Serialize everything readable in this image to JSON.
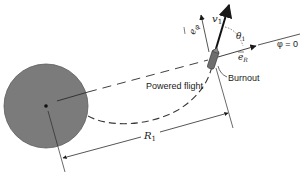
{
  "diagram": {
    "labels": {
      "powered_flight": "Powered flight",
      "burnout": "Burnout",
      "phi_zero": "φ = 0",
      "v1": "v",
      "v1_sub": "1",
      "theta1": "θ",
      "theta1_sub": "1",
      "e_R": "e",
      "e_R_sub": "R",
      "e_phi": "e",
      "e_phi_sub": "φ",
      "R1": "R",
      "R1_sub": "1"
    },
    "elements": [
      {
        "id": "planet",
        "type": "circle",
        "description": "Central body (filled gray disc) with center point marker"
      },
      {
        "id": "reference-axis",
        "type": "dashed-line",
        "description": "Radial line from planet center through burnout point, labeled phi = 0"
      },
      {
        "id": "powered-flight-path",
        "type": "dashed-curve",
        "description": "Trajectory from planet surface to burnout"
      },
      {
        "id": "rocket",
        "type": "shape",
        "description": "Rocket at burnout point"
      },
      {
        "id": "velocity-vector",
        "type": "arrow",
        "description": "Velocity v1 at burnout"
      },
      {
        "id": "unit-vector-eR",
        "type": "arrow",
        "description": "Radial unit vector e_R"
      },
      {
        "id": "unit-vector-ephi",
        "type": "arrow",
        "description": "Transverse unit vector e_phi"
      },
      {
        "id": "flight-angle",
        "type": "arc",
        "description": "Angle theta1 between v1 and e_R"
      },
      {
        "id": "radius-dimension",
        "type": "dimension-line",
        "description": "Distance R1 from planet center to burnout"
      }
    ],
    "colors": {
      "planet_fill": "#7b7b7b",
      "planet_stroke": "#555555",
      "line": "#2a2a2a",
      "rocket_fill": "#6e6e6e",
      "background": "#ffffff"
    }
  }
}
